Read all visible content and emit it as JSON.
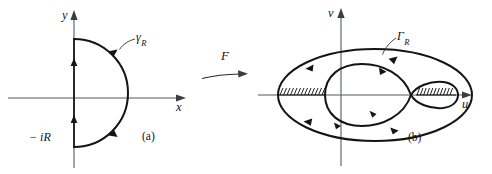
{
  "figure": {
    "kind": "complex-analysis-contour-mapping-diagram",
    "background_color": "#ffffff",
    "ink_color": "#141414",
    "axis_color": "#555a5e",
    "width": 492,
    "height": 174
  },
  "panel_a": {
    "tag": "(a)",
    "axis_x_label": "x",
    "axis_y_label": "y",
    "contour_label": "γ",
    "contour_label_sub": "R",
    "point_label": "− iR",
    "description": "Closed contour in the z-plane: right semicircle of radius R joined by the vertical segment from -iR to iR along the imaginary axis, traversed counterclockwise.",
    "direction_arrows": 4
  },
  "mapping": {
    "label": "F",
    "description": "Arrow indicating the map F from the z-plane to the w-plane."
  },
  "panel_b": {
    "tag": "(b)",
    "axis_x_label": "u",
    "axis_y_label": "v",
    "contour_label": "Γ",
    "contour_label_sub": "R",
    "description": "Image of the contour under F: a large outer oval plus an inner figure-eight curve; two hatched branch cuts lie on the real axis, a long one on the left and a short one inside the small right loop.",
    "outer_direction_arrows": 4,
    "inner_direction_arrows": 3,
    "branch_cuts": [
      {
        "name": "left-branch-cut",
        "hatched": true,
        "side": "left"
      },
      {
        "name": "right-branch-cut",
        "hatched": true,
        "side": "right"
      }
    ]
  }
}
